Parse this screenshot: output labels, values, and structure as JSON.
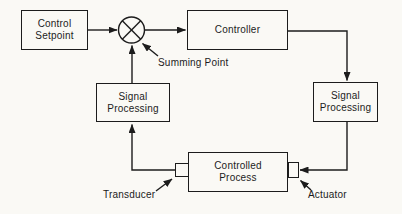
{
  "diagram": {
    "type": "control-loop-block-diagram",
    "colors": {
      "background": "#faf9f5",
      "ink": "#1c1c1c"
    },
    "boxes": {
      "control_setpoint": {
        "lines": [
          "Control",
          "Setpoint"
        ]
      },
      "controller": {
        "lines": [
          "Controller"
        ]
      },
      "signal_processing_left": {
        "lines": [
          "Signal",
          "Processing"
        ]
      },
      "signal_processing_right": {
        "lines": [
          "Signal",
          "Processing"
        ]
      },
      "controlled_process": {
        "lines": [
          "Controlled",
          "Process"
        ]
      }
    },
    "labels": {
      "summing_point": "Summing Point",
      "transducer": "Transducer",
      "actuator": "Actuator"
    }
  }
}
